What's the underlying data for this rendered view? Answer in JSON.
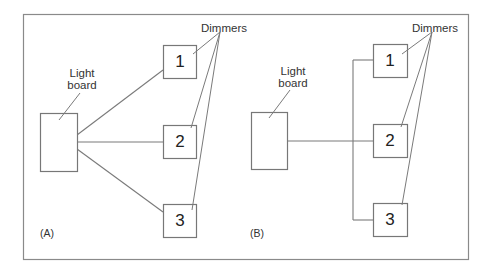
{
  "figure": {
    "panels": [
      {
        "id": "A",
        "tag": "(A)",
        "light_board_label_line1": "Light",
        "light_board_label_line2": "board",
        "dimmers_label": "Dimmers",
        "dimmers": [
          {
            "number": "1"
          },
          {
            "number": "2"
          },
          {
            "number": "3"
          }
        ],
        "wiring": "Each dimmer is connected to the light board by its own separate line (star configuration)"
      },
      {
        "id": "B",
        "tag": "(B)",
        "light_board_label_line1": "Light",
        "light_board_label_line2": "board",
        "dimmers_label": "Dimmers",
        "dimmers": [
          {
            "number": "1"
          },
          {
            "number": "2"
          },
          {
            "number": "3"
          }
        ],
        "wiring": "A single line from the light board joins a common vertical bus that connects all dimmers (daisy/bus configuration)"
      }
    ],
    "colors": {
      "line": "#7a7a7a",
      "frame": "#8a8a8a",
      "text": "#333333",
      "background": "#ffffff"
    }
  }
}
